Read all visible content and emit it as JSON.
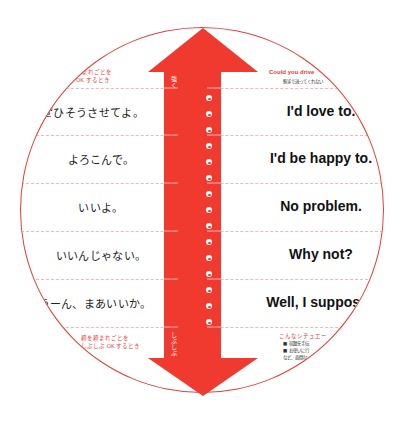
{
  "header": {
    "left_note": [
      "頼まれごとを",
      "OK するとき"
    ],
    "right_title": "Could you drive",
    "right_subtitle": "駅まで送ってくれない"
  },
  "scale": {
    "top_label": "強く",
    "bottom_label": "しぶしぶ"
  },
  "rows": [
    {
      "jp": "ぜひそうさせてよ。",
      "en": "I'd love to."
    },
    {
      "jp": "よろこんで。",
      "en": "I'd be happy to."
    },
    {
      "jp": "いいよ。",
      "en": "No problem."
    },
    {
      "jp": "いいんじゃない。",
      "en": "Why not?"
    },
    {
      "jp": "うーん、まあいいか。",
      "en": "Well, I suppose"
    }
  ],
  "footer": {
    "left_note": [
      "頼を頼まれごとを",
      "しぶしぶ OK するとき"
    ],
    "right_title": "こんなシチュエー",
    "right_items": [
      "■ 宿題を手伝",
      "■ お使いに行",
      "など、面倒な"
    ]
  },
  "colors": {
    "accent_red": "#f03a30",
    "ring_red": "#e0403a",
    "divider": "#f0b8b4",
    "text": "#222222"
  }
}
